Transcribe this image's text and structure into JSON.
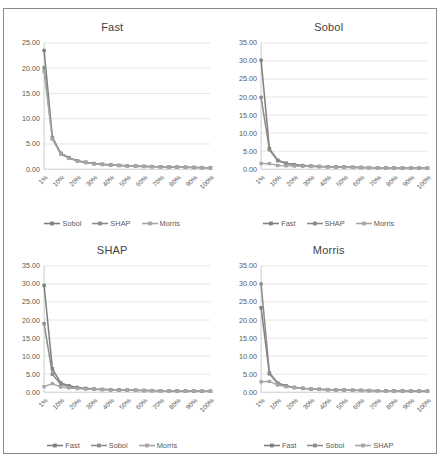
{
  "figure": {
    "background": "#ffffff",
    "frame_color": "#8a8a8a",
    "gridline_color": "#d9d9d9",
    "axis_color": "#bfbfbf",
    "text_color": "#595959"
  },
  "colors": {
    "series1": "#7f7f7f",
    "series2": "#8c8c8c",
    "series3": "#a6a6a6"
  },
  "chart_data": [
    {
      "type": "line",
      "title": "Fast",
      "xlabel": "",
      "ylabel": "",
      "grid": true,
      "legend_position": "bottom",
      "categories": [
        "1%",
        "10%",
        "20%",
        "30%",
        "40%",
        "50%",
        "60%",
        "70%",
        "80%",
        "90%",
        "100%"
      ],
      "x": [
        "1%",
        "5%",
        "10%",
        "15%",
        "20%",
        "25%",
        "30%",
        "35%",
        "40%",
        "45%",
        "50%",
        "55%",
        "60%",
        "65%",
        "70%",
        "75%",
        "80%",
        "85%",
        "90%",
        "95%",
        "100%"
      ],
      "ytick_labels": [
        "0.00",
        "5.00",
        "10.00",
        "15.00",
        "20.00",
        "25.00"
      ],
      "ylim": [
        0,
        25
      ],
      "ystep": 5,
      "series": [
        {
          "name": "Sobol",
          "values": [
            23.5,
            6.3,
            3.2,
            2.3,
            1.7,
            1.4,
            1.15,
            1.0,
            0.88,
            0.78,
            0.7,
            0.64,
            0.58,
            0.54,
            0.5,
            0.46,
            0.43,
            0.4,
            0.37,
            0.34,
            0.3
          ]
        },
        {
          "name": "SHAP",
          "values": [
            20.1,
            6.1,
            3.1,
            2.2,
            1.65,
            1.35,
            1.1,
            0.96,
            0.85,
            0.75,
            0.67,
            0.61,
            0.56,
            0.52,
            0.48,
            0.44,
            0.41,
            0.38,
            0.35,
            0.32,
            0.29
          ]
        },
        {
          "name": "Morris",
          "values": [
            19.4,
            5.95,
            3.0,
            2.15,
            1.6,
            1.3,
            1.07,
            0.93,
            0.82,
            0.73,
            0.65,
            0.59,
            0.54,
            0.5,
            0.46,
            0.43,
            0.4,
            0.37,
            0.34,
            0.31,
            0.28
          ]
        }
      ]
    },
    {
      "type": "line",
      "title": "Sobol",
      "xlabel": "",
      "ylabel": "",
      "grid": true,
      "legend_position": "bottom",
      "categories": [
        "1%",
        "10%",
        "20%",
        "30%",
        "40%",
        "50%",
        "60%",
        "70%",
        "80%",
        "90%",
        "100%"
      ],
      "x": [
        "1%",
        "5%",
        "10%",
        "15%",
        "20%",
        "25%",
        "30%",
        "35%",
        "40%",
        "45%",
        "50%",
        "55%",
        "60%",
        "65%",
        "70%",
        "75%",
        "80%",
        "85%",
        "90%",
        "95%",
        "100%"
      ],
      "ytick_labels": [
        "0.00",
        "5.00",
        "10.00",
        "15.00",
        "20.00",
        "25.00",
        "30.00",
        "35.00"
      ],
      "ylim": [
        0,
        35
      ],
      "ystep": 5,
      "series": [
        {
          "name": "Fast",
          "values": [
            30.2,
            5.7,
            2.5,
            1.7,
            1.3,
            1.05,
            0.9,
            0.8,
            0.72,
            0.65,
            0.6,
            0.55,
            0.51,
            0.47,
            0.44,
            0.41,
            0.38,
            0.35,
            0.33,
            0.31,
            0.28
          ]
        },
        {
          "name": "SHAP",
          "values": [
            19.9,
            5.4,
            2.35,
            1.6,
            1.24,
            1.0,
            0.86,
            0.76,
            0.69,
            0.62,
            0.57,
            0.53,
            0.49,
            0.45,
            0.42,
            0.39,
            0.37,
            0.34,
            0.32,
            0.3,
            0.27
          ]
        },
        {
          "name": "Morris",
          "values": [
            1.6,
            1.55,
            1.05,
            0.95,
            0.88,
            0.8,
            0.74,
            0.68,
            0.63,
            0.59,
            0.55,
            0.51,
            0.48,
            0.45,
            0.42,
            0.39,
            0.37,
            0.34,
            0.32,
            0.3,
            0.27
          ]
        }
      ]
    },
    {
      "type": "line",
      "title": "SHAP",
      "xlabel": "",
      "ylabel": "",
      "grid": true,
      "legend_position": "bottom",
      "categories": [
        "1%",
        "10%",
        "20%",
        "30%",
        "40%",
        "50%",
        "60%",
        "70%",
        "80%",
        "90%",
        "100%"
      ],
      "x": [
        "1%",
        "5%",
        "10%",
        "15%",
        "20%",
        "25%",
        "30%",
        "35%",
        "40%",
        "45%",
        "50%",
        "55%",
        "60%",
        "65%",
        "70%",
        "75%",
        "80%",
        "85%",
        "90%",
        "95%",
        "100%"
      ],
      "ytick_labels": [
        "0.00",
        "5.00",
        "10.00",
        "15.00",
        "20.00",
        "25.00",
        "30.00",
        "35.00"
      ],
      "ylim": [
        0,
        35
      ],
      "ystep": 5,
      "series": [
        {
          "name": "Fast",
          "values": [
            29.6,
            6.5,
            2.6,
            1.8,
            1.35,
            1.1,
            0.92,
            0.81,
            0.73,
            0.66,
            0.6,
            0.56,
            0.51,
            0.48,
            0.44,
            0.41,
            0.38,
            0.36,
            0.33,
            0.31,
            0.28
          ]
        },
        {
          "name": "Sobol",
          "values": [
            19.0,
            5.0,
            2.2,
            1.55,
            1.2,
            0.98,
            0.84,
            0.75,
            0.68,
            0.62,
            0.57,
            0.52,
            0.48,
            0.45,
            0.42,
            0.39,
            0.36,
            0.34,
            0.32,
            0.3,
            0.27
          ]
        },
        {
          "name": "Morris",
          "values": [
            1.55,
            2.4,
            1.45,
            1.2,
            1.02,
            0.9,
            0.8,
            0.72,
            0.66,
            0.6,
            0.56,
            0.52,
            0.48,
            0.45,
            0.42,
            0.39,
            0.37,
            0.34,
            0.32,
            0.3,
            0.27
          ]
        }
      ]
    },
    {
      "type": "line",
      "title": "Morris",
      "xlabel": "",
      "ylabel": "",
      "grid": true,
      "legend_position": "bottom",
      "categories": [
        "1%",
        "10%",
        "20%",
        "30%",
        "40%",
        "50%",
        "60%",
        "70%",
        "80%",
        "90%",
        "100%"
      ],
      "x": [
        "1%",
        "5%",
        "10%",
        "15%",
        "20%",
        "25%",
        "30%",
        "35%",
        "40%",
        "45%",
        "50%",
        "55%",
        "60%",
        "65%",
        "70%",
        "75%",
        "80%",
        "85%",
        "90%",
        "95%",
        "100%"
      ],
      "ytick_labels": [
        "0.00",
        "5.00",
        "10.00",
        "15.00",
        "20.00",
        "25.00",
        "30.00",
        "35.00"
      ],
      "ylim": [
        0,
        35
      ],
      "ystep": 5,
      "series": [
        {
          "name": "Fast",
          "values": [
            23.4,
            5.1,
            2.45,
            1.75,
            1.32,
            1.08,
            0.91,
            0.8,
            0.72,
            0.65,
            0.6,
            0.55,
            0.51,
            0.47,
            0.44,
            0.41,
            0.38,
            0.36,
            0.33,
            0.31,
            0.28
          ]
        },
        {
          "name": "Sobol",
          "values": [
            30.0,
            5.4,
            2.55,
            1.8,
            1.36,
            1.11,
            0.94,
            0.82,
            0.74,
            0.67,
            0.61,
            0.56,
            0.52,
            0.48,
            0.45,
            0.42,
            0.39,
            0.36,
            0.34,
            0.32,
            0.29
          ]
        },
        {
          "name": "SHAP",
          "values": [
            2.9,
            3.0,
            2.0,
            1.55,
            1.24,
            1.02,
            0.88,
            0.78,
            0.7,
            0.64,
            0.58,
            0.54,
            0.5,
            0.46,
            0.43,
            0.4,
            0.37,
            0.35,
            0.33,
            0.31,
            0.28
          ]
        }
      ]
    }
  ]
}
